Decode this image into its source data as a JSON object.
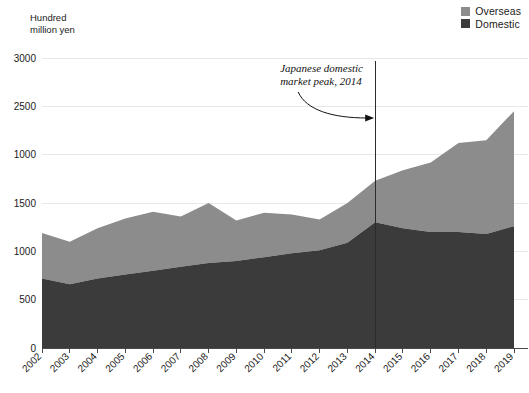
{
  "legend": {
    "position": "top-right",
    "items": [
      {
        "label": "Overseas",
        "color": "#8c8c8c"
      },
      {
        "label": "Domestic",
        "color": "#3b3b3b"
      }
    ]
  },
  "axis": {
    "y_title": "Hundred\nmillion yen"
  },
  "annotation": {
    "line1": "Japanese domestic",
    "line2": "market peak, 2014",
    "target_year": "2014"
  },
  "chart_data": {
    "type": "area",
    "stacked": true,
    "title": "",
    "subtitle": "",
    "xlabel": "",
    "ylabel": "Hundred million yen",
    "grid": true,
    "legend_position": "top-right",
    "x": [
      "2002",
      "2003",
      "2004",
      "2005",
      "2006",
      "2007",
      "2008",
      "2009",
      "2010",
      "2011",
      "2012",
      "2013",
      "2014",
      "2015",
      "2016",
      "2017",
      "2018",
      "2019"
    ],
    "ytick_labels": [
      "3000",
      "2500",
      "1000",
      "1500",
      "1000",
      "500",
      "0"
    ],
    "ytick_values": [
      3000,
      2500,
      2000,
      1500,
      1000,
      500,
      0
    ],
    "ylim": [
      0,
      3000
    ],
    "series": [
      {
        "name": "Domestic",
        "color": "#3b3b3b",
        "values": [
          720,
          660,
          720,
          760,
          800,
          840,
          880,
          900,
          940,
          980,
          1010,
          1090,
          1300,
          1240,
          1200,
          1200,
          1180,
          1260
        ]
      },
      {
        "name": "Overseas",
        "color": "#8c8c8c",
        "values": [
          470,
          440,
          520,
          580,
          610,
          520,
          620,
          420,
          460,
          400,
          320,
          410,
          430,
          600,
          720,
          920,
          970,
          1190
        ]
      }
    ],
    "totals": [
      1190,
      1100,
      1240,
      1340,
      1410,
      1360,
      1500,
      1320,
      1400,
      1380,
      1330,
      1500,
      1730,
      1840,
      1920,
      2120,
      2150,
      2450
    ],
    "annotations": [
      {
        "text": "Japanese domestic market peak, 2014",
        "at_x": "2014",
        "type": "vline-with-arrow"
      }
    ]
  }
}
